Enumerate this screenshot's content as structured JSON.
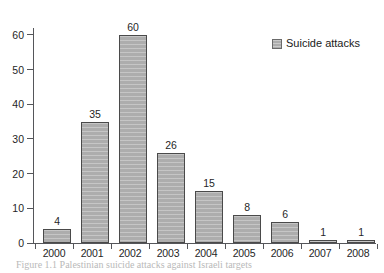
{
  "chart_data": {
    "type": "bar",
    "title": "",
    "subtitle": "",
    "xlabel": "",
    "ylabel": "",
    "categories": [
      "2000",
      "2001",
      "2002",
      "2003",
      "2004",
      "2005",
      "2006",
      "2007",
      "2008"
    ],
    "values": [
      4,
      35,
      60,
      26,
      15,
      8,
      6,
      1,
      1
    ],
    "data_labels": [
      "4",
      "35",
      "60",
      "26",
      "15",
      "8",
      "6",
      "1",
      "1"
    ],
    "series": [
      {
        "name": "Suicide attacks",
        "values": [
          4,
          35,
          60,
          26,
          15,
          8,
          6,
          1,
          1
        ]
      }
    ],
    "ylim": [
      0,
      62
    ],
    "y_ticks": [
      0,
      10,
      20,
      30,
      40,
      50,
      60
    ],
    "y_tick_labels": [
      "0",
      "10",
      "20",
      "30",
      "40",
      "50",
      "60"
    ],
    "grid": false,
    "legend_position": "top-right",
    "bar_color": "#adadad",
    "bar_border_color": "#4a4a4a",
    "axis_color": "#55565a",
    "background_color": "#ffffff"
  },
  "legend": {
    "swatch_name": "legend-swatch",
    "label": "Suicide attacks"
  },
  "caption": {
    "text": "Figure 1.1 Palestinian suicide attacks against Israeli targets"
  }
}
